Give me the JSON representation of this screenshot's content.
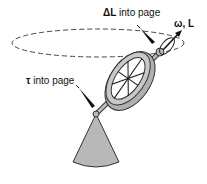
{
  "diagram": {
    "labels": {
      "delta_L": {
        "symbol": "ΔL",
        "text": "into page"
      },
      "omega_L": {
        "text": "ω, L"
      },
      "tau": {
        "symbol": "τ",
        "text": "into page"
      }
    },
    "colors": {
      "fill": "#b8b8b8",
      "stroke": "#333333",
      "arrow": "#111111",
      "dashed": "#444444"
    }
  }
}
